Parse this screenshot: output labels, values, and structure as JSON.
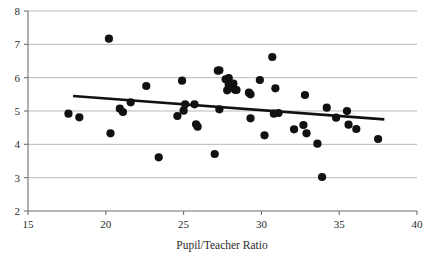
{
  "chart_data": {
    "type": "scatter",
    "title": "",
    "xlabel": "Pupil/Teacher Ratio",
    "ylabel": "",
    "xlim": [
      15,
      40
    ],
    "ylim": [
      2,
      8
    ],
    "xticks": [
      15,
      20,
      25,
      30,
      35,
      40
    ],
    "yticks": [
      2,
      3,
      4,
      5,
      6,
      7,
      8
    ],
    "xtick_labels": [
      "15",
      "20",
      "25",
      "30",
      "35",
      "40"
    ],
    "ytick_labels": [
      "2",
      "3",
      "4",
      "5",
      "6",
      "7",
      "8"
    ],
    "grid": "horizontal",
    "legend": "none",
    "marker": "filled-circle",
    "marker_color": "#111111",
    "points": [
      [
        17.6,
        4.92
      ],
      [
        18.3,
        4.81
      ],
      [
        20.2,
        7.17
      ],
      [
        20.3,
        4.33
      ],
      [
        20.9,
        5.07
      ],
      [
        21.1,
        4.97
      ],
      [
        21.6,
        5.26
      ],
      [
        22.6,
        5.75
      ],
      [
        23.4,
        3.61
      ],
      [
        24.6,
        4.85
      ],
      [
        24.9,
        5.91
      ],
      [
        25.0,
        5.01
      ],
      [
        25.1,
        5.2
      ],
      [
        25.7,
        5.2
      ],
      [
        25.8,
        4.6
      ],
      [
        25.9,
        4.53
      ],
      [
        27.0,
        3.71
      ],
      [
        27.2,
        6.21
      ],
      [
        27.3,
        6.22
      ],
      [
        27.3,
        5.05
      ],
      [
        27.7,
        5.95
      ],
      [
        27.8,
        5.62
      ],
      [
        27.9,
        5.99
      ],
      [
        27.9,
        5.79
      ],
      [
        28.2,
        5.82
      ],
      [
        28.3,
        5.64
      ],
      [
        28.4,
        5.63
      ],
      [
        29.2,
        5.55
      ],
      [
        29.3,
        5.5
      ],
      [
        29.3,
        4.78
      ],
      [
        29.9,
        5.93
      ],
      [
        30.2,
        4.27
      ],
      [
        30.7,
        6.62
      ],
      [
        30.8,
        4.92
      ],
      [
        30.9,
        5.68
      ],
      [
        31.1,
        4.94
      ],
      [
        32.1,
        4.45
      ],
      [
        32.7,
        4.58
      ],
      [
        32.8,
        5.48
      ],
      [
        32.9,
        4.33
      ],
      [
        33.6,
        4.02
      ],
      [
        33.9,
        3.02
      ],
      [
        34.2,
        5.1
      ],
      [
        34.8,
        4.8
      ],
      [
        35.5,
        5.0
      ],
      [
        35.6,
        4.59
      ],
      [
        36.1,
        4.46
      ],
      [
        37.5,
        4.16
      ]
    ],
    "trendline": {
      "type": "linear-fit",
      "x_start": 17.9,
      "y_start": 5.45,
      "x_end": 37.9,
      "y_end": 4.75
    }
  }
}
